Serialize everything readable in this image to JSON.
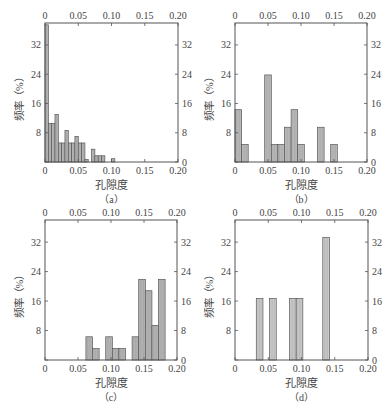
{
  "chart_data": [
    {
      "type": "bar",
      "panel_label": "（a）",
      "xlabel": "孔隙度",
      "ylabel": "频率（%）",
      "xlim": [
        0,
        0.2
      ],
      "ylim": [
        0,
        38
      ],
      "x_ticks": [
        "0",
        "0.05",
        "0.10",
        "0.15",
        "0.20"
      ],
      "y_ticks": [
        "0",
        "8",
        "16",
        "24",
        "32"
      ],
      "bin_width": 0.005,
      "bins": [
        {
          "x0": 0.0,
          "value": 37.5
        },
        {
          "x0": 0.005,
          "value": 10.5
        },
        {
          "x0": 0.01,
          "value": 10.5
        },
        {
          "x0": 0.015,
          "value": 13.0
        },
        {
          "x0": 0.02,
          "value": 5.2
        },
        {
          "x0": 0.025,
          "value": 5.2
        },
        {
          "x0": 0.03,
          "value": 8.6
        },
        {
          "x0": 0.035,
          "value": 5.2
        },
        {
          "x0": 0.04,
          "value": 5.2
        },
        {
          "x0": 0.045,
          "value": 7.0
        },
        {
          "x0": 0.05,
          "value": 5.2
        },
        {
          "x0": 0.055,
          "value": 5.2
        },
        {
          "x0": 0.06,
          "value": 0.7
        },
        {
          "x0": 0.07,
          "value": 3.5
        },
        {
          "x0": 0.075,
          "value": 1.7
        },
        {
          "x0": 0.08,
          "value": 1.7
        },
        {
          "x0": 0.085,
          "value": 1.7
        },
        {
          "x0": 0.1,
          "value": 0.9
        }
      ],
      "grid": false
    },
    {
      "type": "bar",
      "panel_label": "（b）",
      "xlabel": "孔隙度",
      "ylabel": "频率（%）",
      "xlim": [
        0,
        0.2
      ],
      "ylim": [
        0,
        38
      ],
      "x_ticks": [
        "0",
        "0.05",
        "0.10",
        "0.15",
        "0.20"
      ],
      "y_ticks": [
        "0",
        "8",
        "16",
        "24",
        "32"
      ],
      "bin_width": 0.01,
      "bins": [
        {
          "x0": 0.0,
          "value": 14.3
        },
        {
          "x0": 0.01,
          "value": 4.8
        },
        {
          "x0": 0.045,
          "value": 23.8
        },
        {
          "x0": 0.055,
          "value": 4.8
        },
        {
          "x0": 0.065,
          "value": 4.8
        },
        {
          "x0": 0.075,
          "value": 9.5
        },
        {
          "x0": 0.085,
          "value": 14.3
        },
        {
          "x0": 0.095,
          "value": 4.8
        },
        {
          "x0": 0.125,
          "value": 9.5
        },
        {
          "x0": 0.145,
          "value": 4.8
        }
      ],
      "grid": false
    },
    {
      "type": "bar",
      "panel_label": "（c）",
      "xlabel": "孔隙度",
      "ylabel": "频率（%）",
      "xlim": [
        0,
        0.2
      ],
      "ylim": [
        0,
        38
      ],
      "x_ticks": [
        "0",
        "0.05",
        "0.10",
        "0.15",
        "0.20"
      ],
      "y_ticks": [
        "0",
        "8",
        "16",
        "24",
        "32"
      ],
      "bin_width": 0.01,
      "bins": [
        {
          "x0": 0.062,
          "value": 6.3
        },
        {
          "x0": 0.072,
          "value": 3.1
        },
        {
          "x0": 0.092,
          "value": 6.3
        },
        {
          "x0": 0.102,
          "value": 3.1
        },
        {
          "x0": 0.112,
          "value": 3.1
        },
        {
          "x0": 0.132,
          "value": 6.3
        },
        {
          "x0": 0.142,
          "value": 21.9
        },
        {
          "x0": 0.152,
          "value": 18.8
        },
        {
          "x0": 0.162,
          "value": 9.4
        },
        {
          "x0": 0.172,
          "value": 21.9
        }
      ],
      "grid": false
    },
    {
      "type": "bar",
      "panel_label": "（d）",
      "xlabel": "孔隙度",
      "ylabel": "频率（%）",
      "xlim": [
        0,
        0.2
      ],
      "ylim": [
        0,
        38
      ],
      "x_ticks": [
        "0",
        "0.05",
        "0.10",
        "0.15",
        "0.20"
      ],
      "y_ticks": [
        "0",
        "8",
        "16",
        "24",
        "32"
      ],
      "bin_width": 0.01,
      "bins": [
        {
          "x0": 0.032,
          "value": 16.7
        },
        {
          "x0": 0.052,
          "value": 16.7
        },
        {
          "x0": 0.082,
          "value": 16.7
        },
        {
          "x0": 0.092,
          "value": 16.7
        },
        {
          "x0": 0.132,
          "value": 33.3
        }
      ],
      "grid": false
    }
  ],
  "style": {
    "bar_fill_a": "#b8b8b8",
    "bar_fill_b": "#bdbdbd",
    "bar_fill_c": "#b8b8b8",
    "bar_fill_d": "#d0d0d0",
    "bar_stroke": "#555555",
    "axis_color": "#555555"
  }
}
